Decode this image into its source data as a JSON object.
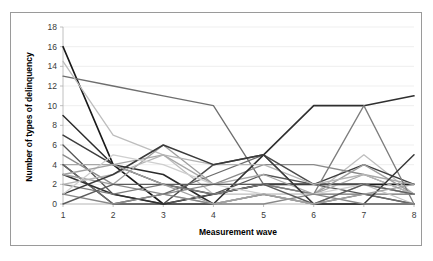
{
  "figure": {
    "name": "line-chart-delinquency-trajectories",
    "background_color": "#ffffff",
    "border_color": "#9a9a9a"
  },
  "chart_data": {
    "type": "line",
    "title": "",
    "subtitle": "",
    "xlabel": "Measurement wave",
    "ylabel": "Number of types of delinquency",
    "x": [
      1,
      2,
      3,
      4,
      5,
      6,
      7,
      8
    ],
    "categories": [
      "1",
      "2",
      "3",
      "4",
      "5",
      "6",
      "7",
      "8"
    ],
    "xtick_labels": [
      "1",
      "2",
      "3",
      "4",
      "5",
      "6",
      "7",
      "8"
    ],
    "ytick_labels": [
      "0",
      "2",
      "4",
      "6",
      "8",
      "10",
      "12",
      "14",
      "16",
      "18"
    ],
    "ytick_values": [
      0,
      2,
      4,
      6,
      8,
      10,
      12,
      14,
      16,
      18
    ],
    "xlim": [
      1,
      8
    ],
    "ylim": [
      0,
      18
    ],
    "grid": "horizontal",
    "grid_color": "#e8e8e8",
    "legend": "none",
    "legend_position": "none",
    "annotations": [],
    "series": [
      {
        "name": "case-01",
        "color": "#1a1a1a",
        "width": 1.6,
        "values": [
          16,
          4,
          0,
          1,
          2,
          2,
          2,
          2
        ]
      },
      {
        "name": "case-02",
        "color": "#6e6e6e",
        "width": 1.3,
        "values": [
          13,
          12,
          11,
          10,
          2,
          1,
          1,
          1
        ]
      },
      {
        "name": "case-03",
        "color": "#bdbdbd",
        "width": 1.3,
        "values": [
          14.5,
          7,
          5,
          1,
          1,
          1,
          5,
          1
        ]
      },
      {
        "name": "case-04",
        "color": "#2b2b2b",
        "width": 1.5,
        "values": [
          9,
          4,
          3,
          0,
          1,
          0,
          0,
          0
        ]
      },
      {
        "name": "case-05",
        "color": "#3d3d3d",
        "width": 1.5,
        "values": [
          7,
          4,
          2,
          1,
          2,
          2,
          4,
          2
        ]
      },
      {
        "name": "case-06",
        "color": "#555555",
        "width": 1.3,
        "values": [
          6,
          1,
          0,
          1,
          3,
          2,
          1,
          0
        ]
      },
      {
        "name": "case-07",
        "color": "#8a8a8a",
        "width": 1.3,
        "values": [
          5,
          2,
          1,
          2,
          4,
          4,
          3,
          1
        ]
      },
      {
        "name": "case-08",
        "color": "#a8a8a8",
        "width": 1.3,
        "values": [
          4,
          4,
          5,
          2,
          3,
          1,
          3,
          2
        ]
      },
      {
        "name": "case-09",
        "color": "#c4c4c4",
        "width": 1.3,
        "values": [
          4,
          0,
          1,
          0,
          1,
          0,
          2,
          0
        ]
      },
      {
        "name": "case-10",
        "color": "#4a4a4a",
        "width": 1.5,
        "values": [
          4,
          0,
          0,
          4,
          5,
          2,
          2,
          1
        ]
      },
      {
        "name": "case-11",
        "color": "#6b6b6b",
        "width": 1.3,
        "values": [
          4,
          0,
          1,
          3,
          5,
          0,
          1,
          0
        ]
      },
      {
        "name": "case-12",
        "color": "#2f2f2f",
        "width": 1.6,
        "values": [
          3,
          1,
          0,
          0,
          5,
          10,
          10,
          11
        ]
      },
      {
        "name": "case-13",
        "color": "#9e9e9e",
        "width": 1.3,
        "values": [
          3,
          2,
          6,
          2,
          2,
          1,
          4,
          1
        ]
      },
      {
        "name": "case-14",
        "color": "#7d7d7d",
        "width": 1.3,
        "values": [
          2,
          1,
          2,
          1,
          2,
          1,
          10,
          0
        ]
      },
      {
        "name": "case-15",
        "color": "#b5b5b5",
        "width": 1.3,
        "values": [
          2,
          3,
          5,
          4,
          4,
          2,
          3,
          1
        ]
      },
      {
        "name": "case-16",
        "color": "#3a3a3a",
        "width": 1.5,
        "values": [
          1,
          3,
          6,
          4,
          5,
          0,
          0,
          5
        ]
      },
      {
        "name": "case-17",
        "color": "#cfcfcf",
        "width": 1.3,
        "values": [
          1,
          5,
          4,
          2,
          1,
          1,
          2,
          1
        ]
      },
      {
        "name": "case-18",
        "color": "#888888",
        "width": 1.3,
        "values": [
          1,
          0,
          1,
          0,
          0,
          1,
          0,
          0
        ]
      },
      {
        "name": "case-19",
        "color": "#5c5c5c",
        "width": 1.4,
        "values": [
          0,
          2,
          2,
          2,
          2,
          0,
          2,
          1
        ]
      },
      {
        "name": "case-20",
        "color": "#a0a0a0",
        "width": 1.3,
        "values": [
          3,
          4,
          2,
          0,
          1,
          0,
          1,
          2
        ]
      }
    ]
  }
}
